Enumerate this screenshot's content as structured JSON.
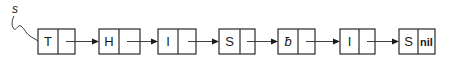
{
  "diagram": {
    "type": "singly-linked-list",
    "head_pointer": {
      "label": "s"
    },
    "nodes": [
      {
        "data": "T",
        "next": ""
      },
      {
        "data": "H",
        "next": ""
      },
      {
        "data": "I",
        "next": ""
      },
      {
        "data": "S",
        "next": ""
      },
      {
        "data": "ƀ",
        "next": "",
        "note": "blank character symbol"
      },
      {
        "data": "I",
        "next": ""
      },
      {
        "data": "S",
        "next": "nil"
      }
    ],
    "colors": {
      "stroke": "#2a2a2a",
      "text": "#1a1a1a",
      "background": "#ffffff"
    }
  }
}
